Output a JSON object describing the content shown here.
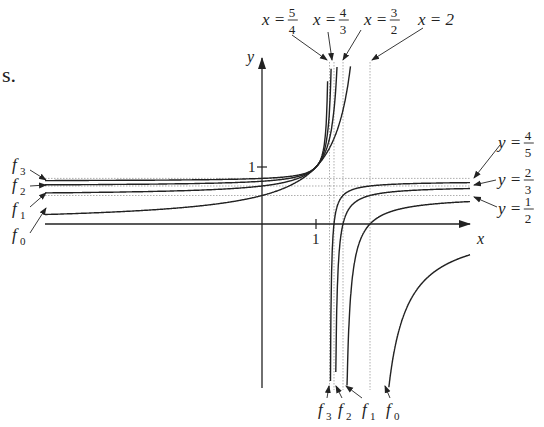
{
  "page_fragment": "s.",
  "chart_data": {
    "type": "line",
    "title": "",
    "xlabel": "x",
    "ylabel": "y",
    "x_tick_labels": [
      "1"
    ],
    "y_tick_labels": [
      "1"
    ],
    "grid": false,
    "series": [
      {
        "name": "f0",
        "label": "f",
        "sub": "0",
        "formula": "1/(2-x)",
        "vertical_asymptote": 2,
        "horizontal_asymptote": 0
      },
      {
        "name": "f1",
        "label": "f",
        "sub": "1",
        "formula": "(2-x)/(3-2x)",
        "vertical_asymptote": 1.5,
        "horizontal_asymptote": 0.5
      },
      {
        "name": "f2",
        "label": "f",
        "sub": "2",
        "formula": "(3-2x)/(4-3x)",
        "vertical_asymptote": 1.3333,
        "horizontal_asymptote": 0.6667
      },
      {
        "name": "f3",
        "label": "f",
        "sub": "3",
        "formula": "(4-3x)/(5-4x)",
        "vertical_asymptote": 1.25,
        "horizontal_asymptote": 0.8
      }
    ],
    "annotations": {
      "vertical": [
        {
          "text": "x =",
          "num": "5",
          "den": "4"
        },
        {
          "text": "x =",
          "num": "4",
          "den": "3"
        },
        {
          "text": "x =",
          "num": "3",
          "den": "2"
        },
        {
          "text": "x = 2"
        }
      ],
      "horizontal": [
        {
          "text": "y =",
          "num": "4",
          "den": "5"
        },
        {
          "text": "y =",
          "num": "2",
          "den": "3"
        },
        {
          "text": "y =",
          "num": "1",
          "den": "2"
        }
      ]
    },
    "common_point": [
      1,
      1
    ],
    "xlim": [
      -4.5,
      4
    ],
    "ylim": [
      -2.9,
      4
    ]
  }
}
